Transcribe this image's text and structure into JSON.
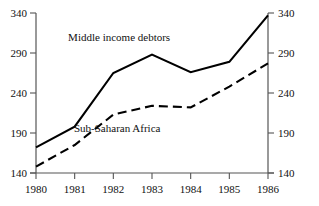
{
  "chart_data": {
    "type": "line",
    "title": "",
    "subtitle": "",
    "xlabel": "",
    "ylabel": "",
    "categories": [
      "1980",
      "1981",
      "1982",
      "1983",
      "1984",
      "1985",
      "1986"
    ],
    "x": [
      1980,
      1981,
      1982,
      1983,
      1984,
      1985,
      1986
    ],
    "xlim": [
      1980,
      1986
    ],
    "ylim": [
      140,
      340
    ],
    "yticks": [
      140,
      190,
      240,
      290,
      340
    ],
    "ytick_labels": [
      "140",
      "190",
      "240",
      "290",
      "340"
    ],
    "right_yticks": [
      140,
      190,
      240,
      290,
      340
    ],
    "right_ytick_labels": [
      "140",
      "190",
      "240",
      "290",
      "340"
    ],
    "xticks": [
      1980,
      1981,
      1982,
      1983,
      1984,
      1985,
      1986
    ],
    "xtick_labels": [
      "1980",
      "1981",
      "1982",
      "1983",
      "1984",
      "1985",
      "1986"
    ],
    "grid": false,
    "legend": "inline-annotations",
    "series": [
      {
        "name": "Middle income debtors",
        "style": "solid",
        "color": "#000000",
        "values": [
          172,
          198,
          265,
          288,
          266,
          279,
          337
        ],
        "label_text": "Middle income debtors",
        "label_x": 1982.15,
        "label_y": 310
      },
      {
        "name": "Sub-Saharan Africa",
        "style": "dashed",
        "color": "#000000",
        "values": [
          148,
          175,
          213,
          224,
          222,
          248,
          277
        ],
        "label_text": "Sub-Saharan Africa",
        "label_x": 1982.1,
        "label_y": 196
      }
    ],
    "annotations": [
      {
        "text": "Middle income debtors",
        "x": 1982.15,
        "y": 310
      },
      {
        "text": "Sub-Saharan Africa",
        "x": 1982.1,
        "y": 196
      }
    ]
  }
}
